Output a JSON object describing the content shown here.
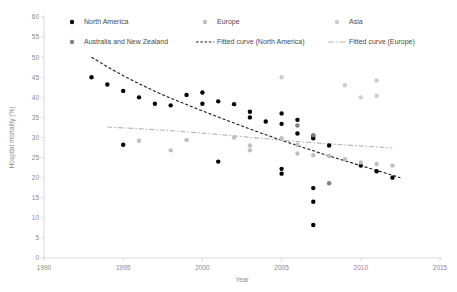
{
  "chart_data": {
    "type": "scatter",
    "title": "",
    "xlabel": "Year",
    "ylabel": "Hospital mortality (%)",
    "xlim": [
      1990,
      2015
    ],
    "ylim": [
      0,
      60
    ],
    "xticks": [
      1990,
      1995,
      2000,
      2005,
      2010,
      2015
    ],
    "yticks": [
      0,
      5,
      10,
      15,
      20,
      25,
      30,
      35,
      40,
      45,
      50,
      55,
      60
    ],
    "grid": false,
    "legend_position": "top",
    "series": [
      {
        "name": "North America",
        "marker": "circle",
        "color": "#000000",
        "points": [
          [
            1993,
            45.0
          ],
          [
            1994,
            43.2
          ],
          [
            1995,
            41.6
          ],
          [
            1996,
            40.0
          ],
          [
            1997,
            38.4
          ],
          [
            1998,
            38.0
          ],
          [
            1999,
            40.6
          ],
          [
            2000,
            41.2
          ],
          [
            2000,
            38.4
          ],
          [
            2001,
            39.0
          ],
          [
            2002,
            38.3
          ],
          [
            2003,
            36.4
          ],
          [
            2003,
            35.0
          ],
          [
            2004,
            34.0
          ],
          [
            2005,
            33.4
          ],
          [
            2005,
            36.0
          ],
          [
            2006,
            34.4
          ],
          [
            2006,
            31.0
          ],
          [
            2007,
            30.4
          ],
          [
            2007,
            29.8
          ],
          [
            2008,
            28.0
          ],
          [
            1995,
            28.2
          ],
          [
            2001,
            24.0
          ],
          [
            2005,
            22.2
          ],
          [
            2005,
            21.0
          ],
          [
            2007,
            17.4
          ],
          [
            2007,
            14.0
          ],
          [
            2007,
            8.2
          ],
          [
            2010,
            23.0
          ],
          [
            2011,
            21.6
          ],
          [
            2012,
            20.0
          ]
        ]
      },
      {
        "name": "Europe",
        "marker": "circle",
        "color": "#bfbfbf",
        "points": [
          [
            1998,
            26.8
          ],
          [
            1999,
            29.4
          ],
          [
            2002,
            30.0
          ],
          [
            2003,
            28.0
          ],
          [
            2003,
            26.8
          ],
          [
            2005,
            29.8
          ],
          [
            2006,
            28.2
          ],
          [
            2006,
            26.0
          ],
          [
            2007,
            25.6
          ],
          [
            2008,
            25.4
          ],
          [
            2009,
            24.6
          ],
          [
            2010,
            23.8
          ],
          [
            2011,
            23.4
          ],
          [
            2012,
            23.0
          ],
          [
            1996,
            29.2
          ]
        ]
      },
      {
        "name": "Asia",
        "marker": "circle",
        "color": "#cccccc",
        "points": [
          [
            2005,
            45.0
          ],
          [
            2009,
            43.0
          ],
          [
            2010,
            40.0
          ],
          [
            2011,
            44.2
          ],
          [
            2011,
            40.4
          ]
        ]
      },
      {
        "name": "Australia and New Zealand",
        "marker": "circle",
        "color": "#808080",
        "points": [
          [
            2006,
            33.0
          ],
          [
            2007,
            30.6
          ],
          [
            2008,
            18.6
          ]
        ]
      }
    ],
    "curves": [
      {
        "name": "Fitted curve (North America)",
        "style": "dashed",
        "color": "#1a1a1a",
        "points": [
          [
            1993,
            50.0
          ],
          [
            1994,
            47.6
          ],
          [
            1995,
            45.4
          ],
          [
            1996,
            43.4
          ],
          [
            1997,
            41.5
          ],
          [
            1998,
            39.8
          ],
          [
            1999,
            38.2
          ],
          [
            2000,
            36.6
          ],
          [
            2001,
            35.1
          ],
          [
            2002,
            33.6
          ],
          [
            2003,
            32.1
          ],
          [
            2004,
            30.7
          ],
          [
            2005,
            29.3
          ],
          [
            2006,
            28.0
          ],
          [
            2007,
            26.7
          ],
          [
            2008,
            25.4
          ],
          [
            2009,
            24.2
          ],
          [
            2010,
            23.0
          ],
          [
            2011,
            21.8
          ],
          [
            2012,
            20.6
          ],
          [
            2012.5,
            20.0
          ]
        ]
      },
      {
        "name": "Fitted curve (Europe)",
        "style": "dash-dot",
        "color": "#b3b3b3",
        "points": [
          [
            1994,
            32.6
          ],
          [
            1996,
            32.2
          ],
          [
            1998,
            31.7
          ],
          [
            2000,
            31.1
          ],
          [
            2002,
            30.4
          ],
          [
            2004,
            29.7
          ],
          [
            2006,
            29.0
          ],
          [
            2008,
            28.4
          ],
          [
            2010,
            27.9
          ],
          [
            2012,
            27.4
          ]
        ]
      }
    ]
  },
  "legend": {
    "items": [
      {
        "label": "North America",
        "kind": "marker",
        "color": "#000000"
      },
      {
        "label": "Europe",
        "kind": "marker",
        "color": "#bfbfbf"
      },
      {
        "label": "Asia",
        "kind": "marker",
        "color": "#cccccc"
      },
      {
        "label": "Australia and New Zealand",
        "kind": "marker",
        "color": "#808080"
      },
      {
        "label": "Fitted curve (North America)",
        "kind": "dashed-line",
        "color": "#1a1a1a"
      },
      {
        "label": "Fitted curve (Europe)",
        "kind": "dash-dot-line",
        "color": "#b3b3b3"
      }
    ]
  }
}
